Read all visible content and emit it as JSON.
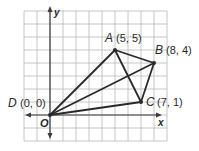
{
  "diagram": {
    "type": "coordinate-plane",
    "grid": {
      "x_min": -2,
      "x_max": 9,
      "y_min": -2,
      "y_max": 8,
      "unit_px": 13,
      "origin_px": [
        50,
        115
      ],
      "line_color": "#b8b8b8"
    },
    "axes": {
      "x_label": "x",
      "y_label": "y",
      "origin_label": "O",
      "color": "#3a3a3a"
    },
    "points": [
      {
        "name": "A",
        "coords": "(5, 5)",
        "x": 5,
        "y": 5
      },
      {
        "name": "B",
        "coords": "(8, 4)",
        "x": 8,
        "y": 4
      },
      {
        "name": "C",
        "coords": "(7, 1)",
        "x": 7,
        "y": 1
      },
      {
        "name": "D",
        "coords": "(0, 0)",
        "x": 0,
        "y": 0
      }
    ],
    "segments": [
      [
        "D",
        "A"
      ],
      [
        "A",
        "B"
      ],
      [
        "B",
        "C"
      ],
      [
        "C",
        "D"
      ],
      [
        "A",
        "C"
      ],
      [
        "D",
        "B"
      ]
    ],
    "segment_color": "#2a2a2a"
  }
}
